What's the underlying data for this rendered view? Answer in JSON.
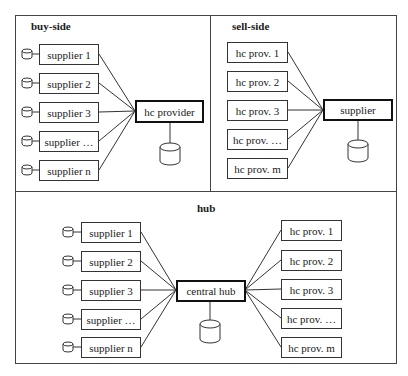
{
  "panels": {
    "buy_side": {
      "title": "buy-side",
      "center": "hc provider",
      "nodes": [
        "supplier 1",
        "supplier 2",
        "supplier 3",
        "supplier …",
        "supplier n"
      ]
    },
    "sell_side": {
      "title": "sell-side",
      "center": "supplier",
      "nodes": [
        "hc prov. 1",
        "hc prov. 2",
        "hc prov. 3",
        "hc prov. …",
        "hc prov. m"
      ]
    },
    "hub": {
      "title": "hub",
      "center": "central hub",
      "left_nodes": [
        "supplier 1",
        "supplier 2",
        "supplier 3",
        "supplier …",
        "supplier n"
      ],
      "right_nodes": [
        "hc prov. 1",
        "hc prov. 2",
        "hc prov. 3",
        "hc prov. …",
        "hc prov. m"
      ]
    }
  },
  "icons": {
    "database": "database-cylinder-icon"
  }
}
